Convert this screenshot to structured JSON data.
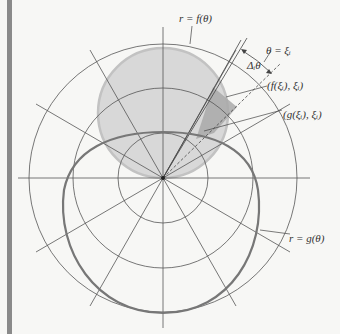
{
  "diagram": {
    "type": "polar-area-between-curves",
    "labels": {
      "f_curve": "r = f(θ)",
      "g_curve": "r = g(θ)",
      "theta_xi": "θ = ξᵢ",
      "delta_theta": "Δᵢθ",
      "point_f": "(f(ξᵢ), ξᵢ)",
      "point_g": "(g(ξᵢ), ξᵢ)"
    },
    "colors": {
      "grid": "#555555",
      "f_fill": "#d6d6d6",
      "f_stroke": "#bdbdbd",
      "g_stroke": "#777777",
      "sector_fill": "#a8a8a8",
      "background": "#f7f7f5",
      "edge_bar": "#8a8a8a"
    },
    "grid": {
      "center": [
        163,
        178
      ],
      "circle_radii": [
        45,
        90,
        135
      ],
      "ray_angles_deg": [
        0,
        30,
        60,
        90,
        120,
        150
      ],
      "ray_length": 148
    }
  }
}
